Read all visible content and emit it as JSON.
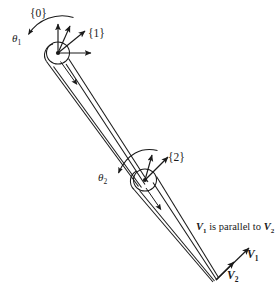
{
  "figure": {
    "background_color": "#ffffff",
    "stroke_color": "#1a1a1a",
    "width": 280,
    "height": 296
  },
  "frames": [
    {
      "id": "frame-0",
      "label": "{0}",
      "x": 30,
      "y": 8
    },
    {
      "id": "frame-1",
      "label": "{1}",
      "x": 88,
      "y": 28
    },
    {
      "id": "frame-2",
      "label": "{2}",
      "x": 168,
      "y": 152
    }
  ],
  "angles": [
    {
      "id": "theta-1",
      "symbol": "θ",
      "subscript": "1",
      "x": 12,
      "y": 33
    },
    {
      "id": "theta-2",
      "symbol": "θ",
      "subscript": "2",
      "x": 98,
      "y": 172
    }
  ],
  "vectors": [
    {
      "id": "v1",
      "symbol": "V",
      "subscript": "1",
      "x": 247,
      "y": 249
    },
    {
      "id": "v2",
      "symbol": "V",
      "subscript": "2",
      "x": 227,
      "y": 270
    }
  ],
  "annotation": {
    "id": "parallel-note",
    "prefix": "V",
    "prefix_sub": "1",
    "middle": " is parallel to ",
    "suffix": "V",
    "suffix_sub": "2",
    "x": 196,
    "y": 222
  },
  "joints": [
    {
      "id": "joint-1",
      "cx": 58,
      "cy": 53
    },
    {
      "id": "joint-2",
      "cx": 145,
      "cy": 180
    }
  ],
  "tip": {
    "id": "end-effector-tip",
    "cx": 216,
    "cy": 280
  },
  "icons": {
    "axis_arrow": "arrow-head",
    "rotation_arrow": "curved-arrow",
    "link_body": "tapered-link"
  }
}
